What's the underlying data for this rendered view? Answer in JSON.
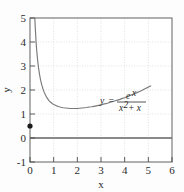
{
  "chart_data": {
    "type": "line",
    "title": "",
    "xlabel": "x",
    "ylabel": "y",
    "xlim": [
      0,
      6
    ],
    "ylim": [
      -1,
      5
    ],
    "xticks": [
      "0",
      "1",
      "2",
      "3",
      "4",
      "5",
      "6"
    ],
    "yticks": [
      "-1",
      "0",
      "1",
      "2",
      "3",
      "4",
      "5"
    ],
    "grid": "dotted-gray-at-integers",
    "legend_position": "inside-right",
    "annotations": [
      {
        "name": "function-equation",
        "lhs": "y",
        "equals": "=",
        "numerator": "e",
        "numerator_exponent": "x",
        "denominator_base": "x",
        "denominator_exponent": "2",
        "denominator_tail": "+ x",
        "plain_text": "y = e^x / (x^2 + x)"
      }
    ],
    "series": [
      {
        "name": "y = e^x/(x^2+x)",
        "color": "#7a7a7a",
        "x": [
          0.18,
          0.2,
          0.22,
          0.25,
          0.28,
          0.32,
          0.36,
          0.4,
          0.45,
          0.5,
          0.55,
          0.6,
          0.65,
          0.7,
          0.75,
          0.8,
          0.85,
          0.9,
          0.95,
          1.0,
          1.1,
          1.2,
          1.3,
          1.4,
          1.5,
          1.6,
          1.7,
          1.8,
          1.9,
          2.0,
          2.1,
          2.2,
          2.3,
          2.4,
          2.5,
          2.6,
          2.7,
          2.8,
          2.9,
          3.0,
          3.1,
          3.2,
          3.3,
          3.4,
          3.5,
          3.6,
          3.7,
          3.8,
          3.9,
          4.0,
          4.1,
          4.2,
          4.3,
          4.4,
          4.5,
          4.6,
          4.7,
          4.8,
          4.9,
          5.0,
          5.05,
          5.1
        ],
        "y": [
          5.66,
          5.09,
          4.65,
          4.11,
          3.69,
          3.26,
          2.93,
          2.66,
          2.4,
          2.2,
          2.04,
          1.9,
          1.8,
          1.7,
          1.63,
          1.56,
          1.51,
          1.47,
          1.43,
          1.4,
          1.35,
          1.31,
          1.28,
          1.26,
          1.25,
          1.24,
          1.23,
          1.23,
          1.23,
          1.23,
          1.24,
          1.25,
          1.26,
          1.27,
          1.29,
          1.3,
          1.32,
          1.34,
          1.36,
          1.38,
          1.41,
          1.43,
          1.46,
          1.49,
          1.52,
          1.55,
          1.58,
          1.61,
          1.65,
          1.68,
          1.72,
          1.76,
          1.8,
          1.84,
          1.88,
          1.93,
          1.97,
          2.02,
          2.07,
          2.12,
          2.15,
          2.17
        ]
      }
    ],
    "markers": [
      {
        "name": "origin-point-marker",
        "x": 0,
        "y": 0.5,
        "color": "#1a1a1a",
        "shape": "filled-circle"
      }
    ],
    "reference_lines": [
      {
        "name": "zero-line",
        "orientation": "horizontal",
        "value": 0,
        "color": "#8a8a8a"
      }
    ]
  }
}
